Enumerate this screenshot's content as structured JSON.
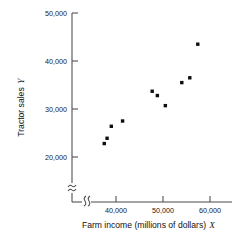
{
  "chart_data": {
    "type": "scatter",
    "title": "",
    "xlabel": "Farm income (millions of dollars) X",
    "ylabel": "Tractor sales Y",
    "xlabel_text": "Farm income (millions of dollars)",
    "xlabel_symbol": "X",
    "ylabel_text": "Tractor sales",
    "ylabel_symbol": "Y",
    "x_ticks": [
      40000,
      50000,
      60000
    ],
    "x_tick_labels": [
      "40,000",
      "50,000",
      "60,000"
    ],
    "y_ticks": [
      20000,
      30000,
      40000,
      50000
    ],
    "y_tick_labels": [
      "20,000",
      "30,000",
      "40,000",
      "50,000"
    ],
    "xlim": [
      36000,
      60000
    ],
    "ylim": [
      20000,
      50000
    ],
    "grid": false,
    "legend": false,
    "axis_break_x": true,
    "axis_break_y": true,
    "marker": "square",
    "marker_color": "#0d0d0d",
    "points": [
      {
        "x": 37500,
        "y": 22800
      },
      {
        "x": 38100,
        "y": 23900
      },
      {
        "x": 39000,
        "y": 26400
      },
      {
        "x": 41400,
        "y": 27500
      },
      {
        "x": 47700,
        "y": 33700
      },
      {
        "x": 48800,
        "y": 32800
      },
      {
        "x": 50500,
        "y": 30700
      },
      {
        "x": 54000,
        "y": 35500
      },
      {
        "x": 55700,
        "y": 36500
      },
      {
        "x": 57400,
        "y": 43500
      }
    ]
  }
}
